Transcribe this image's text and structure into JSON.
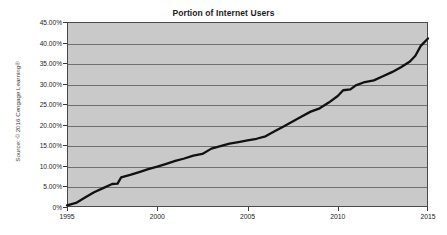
{
  "chart_data": {
    "type": "line",
    "title": "Portion of Internet Users",
    "xlabel": "",
    "ylabel": "",
    "grid": true,
    "legend": "none",
    "xlim": [
      1995,
      2015
    ],
    "ylim": [
      0,
      45
    ],
    "xtick_labels": [
      "1995",
      "2000",
      "2005",
      "2010",
      "2015"
    ],
    "xticks": [
      1995,
      2000,
      2005,
      2010,
      2015
    ],
    "ytick_labels": [
      "0%",
      "5.00%",
      "10.00%",
      "15.00%",
      "20.00%",
      "25.00%",
      "30.00%",
      "35.00%",
      "40.00%",
      "45.00%"
    ],
    "yticks": [
      0,
      5,
      10,
      15,
      20,
      25,
      30,
      35,
      40,
      45
    ],
    "series": [
      {
        "name": "Portion of Internet Users",
        "x": [
          1995,
          1995.5,
          1996,
          1996.5,
          1997,
          1997.5,
          1997.8,
          1998,
          1998.5,
          1999,
          1999.5,
          2000,
          2000.5,
          2001,
          2001.5,
          2002,
          2002.5,
          2003,
          2003.5,
          2004,
          2004.5,
          2005,
          2005.5,
          2006,
          2006.5,
          2007,
          2007.5,
          2008,
          2008.5,
          2009,
          2009.5,
          2010,
          2010.3,
          2010.7,
          2011,
          2011.5,
          2012,
          2012.5,
          2013,
          2013.5,
          2014,
          2014.3,
          2014.6,
          2015
        ],
        "values": [
          0.4,
          1.0,
          2.3,
          3.6,
          4.6,
          5.6,
          5.7,
          7.2,
          7.8,
          8.5,
          9.2,
          9.8,
          10.5,
          11.2,
          11.8,
          12.5,
          12.9,
          14.2,
          14.8,
          15.4,
          15.8,
          16.2,
          16.6,
          17.2,
          18.4,
          19.6,
          20.8,
          22.0,
          23.2,
          24.0,
          25.4,
          27.0,
          28.4,
          28.6,
          29.6,
          30.4,
          30.8,
          31.8,
          32.8,
          34.0,
          35.4,
          36.8,
          39.2,
          41.0
        ]
      }
    ],
    "series_color": "#111111",
    "plot_background": "#c9c9c9",
    "gridline_color": "#6f6f6f"
  },
  "source": {
    "text": "Source: © 2016 Cengage Learning®"
  }
}
